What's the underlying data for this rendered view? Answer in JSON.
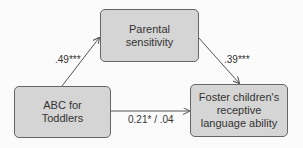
{
  "diagram": {
    "type": "mediation-model",
    "nodes": [
      {
        "id": "abc",
        "label": "ABC for\nToddlers"
      },
      {
        "id": "parental",
        "label": "Parental\nsensitivity"
      },
      {
        "id": "foster",
        "label": "Foster children's\nreceptive\nlanguage ability"
      }
    ],
    "edges": [
      {
        "from": "abc",
        "to": "parental",
        "label": ".49***"
      },
      {
        "from": "parental",
        "to": "foster",
        "label": ".39***"
      },
      {
        "from": "abc",
        "to": "foster",
        "label": "0.21* / .04"
      }
    ],
    "colors": {
      "box_fill": "#d5d5d5",
      "box_border": "#666666",
      "arrow": "#555555",
      "background": "#fbfbfb"
    }
  }
}
